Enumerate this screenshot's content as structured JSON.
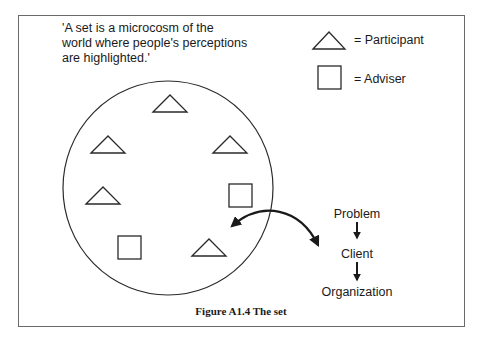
{
  "quote": {
    "line1": "'A set is a microcosm of the",
    "line2": "world where people's perceptions",
    "line3": "are highlighted.'"
  },
  "legend": {
    "participant": {
      "symbol": "triangle",
      "label": "= Participant"
    },
    "adviser": {
      "symbol": "square",
      "label": "= Adviser"
    }
  },
  "set": {
    "shape": "circle",
    "participants_count": 6,
    "advisers_count": 2
  },
  "flow": {
    "items": [
      "Problem",
      "Client",
      "Organization"
    ],
    "connector": "down-arrow"
  },
  "caption": {
    "figure": "Figure A1.4",
    "title": "The set",
    "full": "Figure A1.4  The set"
  },
  "colors": {
    "stroke": "#2a2a2a",
    "frame": "#6a6a6a",
    "background": "#ffffff"
  }
}
